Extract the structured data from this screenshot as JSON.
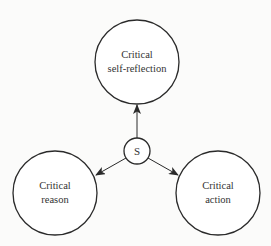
{
  "diagram": {
    "center_node": {
      "label": "S"
    },
    "nodes": [
      {
        "id": "top",
        "line1": "Critical",
        "line2": "self-reflection"
      },
      {
        "id": "left",
        "line1": "Critical",
        "line2": "reason"
      },
      {
        "id": "right",
        "line1": "Critical",
        "line2": "action"
      }
    ],
    "edges": [
      {
        "from": "S",
        "to": "top",
        "arrow": true
      },
      {
        "from": "S",
        "to": "left",
        "arrow": true
      },
      {
        "from": "S",
        "to": "right",
        "arrow": true
      }
    ],
    "colors": {
      "stroke": "#2a2a2a",
      "text": "#333333",
      "background": "#fbfbfa"
    }
  }
}
